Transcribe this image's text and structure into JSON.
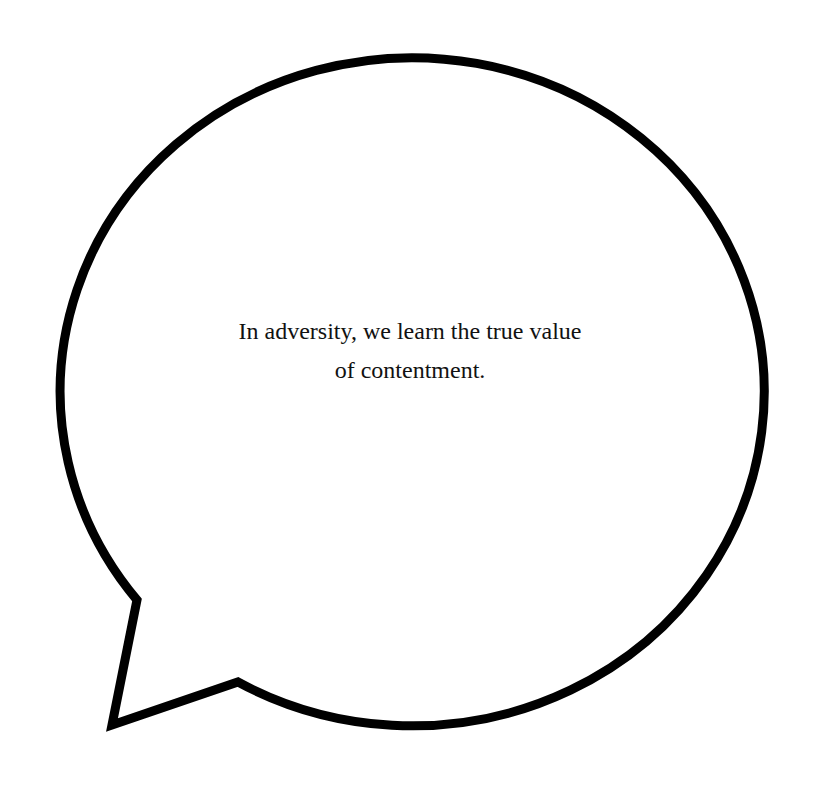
{
  "speech_bubble": {
    "text_lines": [
      "In adversity, we learn the true value",
      "of contentment."
    ],
    "stroke_color": "#000000",
    "fill_color": "#ffffff"
  }
}
